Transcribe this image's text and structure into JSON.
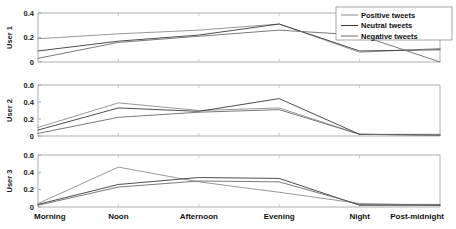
{
  "figure": {
    "background_color": "#ffffff",
    "axis_color": "#9a9a9a"
  },
  "legend": {
    "position": "top-right",
    "entries": [
      {
        "label": "Positive tweets",
        "color": "#8c8c8c"
      },
      {
        "label": "Neutral tweets",
        "color": "#3a3a3a"
      },
      {
        "label": "Negative tweets",
        "color": "#6b6b6b"
      }
    ]
  },
  "xaxis": {
    "categories": [
      "Morning",
      "Noon",
      "Afternoon",
      "Evening",
      "Night",
      "Post-midnight"
    ]
  },
  "chart_data": [
    {
      "type": "line",
      "title": "",
      "xlabel": "",
      "ylabel": "User 1",
      "categories": [
        "Morning",
        "Noon",
        "Afternoon",
        "Evening",
        "Night",
        "Post-midnight"
      ],
      "ylim": [
        0,
        0.4
      ],
      "yticks": [
        0,
        0.2,
        0.4
      ],
      "ytick_labels": [
        "0",
        "0.2",
        "0.4"
      ],
      "grid": false,
      "legend": "top-right",
      "series": [
        {
          "name": "Positive tweets",
          "color": "#8c8c8c",
          "values": [
            0.19,
            0.23,
            0.26,
            0.31,
            0.08,
            0.11
          ]
        },
        {
          "name": "Neutral tweets",
          "color": "#3a3a3a",
          "values": [
            0.09,
            0.17,
            0.22,
            0.31,
            0.09,
            0.1
          ]
        },
        {
          "name": "Negative tweets",
          "color": "#6b6b6b",
          "values": [
            0.03,
            0.16,
            0.21,
            0.26,
            0.22,
            0.0
          ]
        }
      ]
    },
    {
      "type": "line",
      "title": "",
      "xlabel": "",
      "ylabel": "User 2",
      "categories": [
        "Morning",
        "Noon",
        "Afternoon",
        "Evening",
        "Night",
        "Post-midnight"
      ],
      "ylim": [
        0,
        0.6
      ],
      "yticks": [
        0,
        0.2,
        0.4,
        0.6
      ],
      "ytick_labels": [
        "0",
        "0.2",
        "0.4",
        "0.6"
      ],
      "grid": false,
      "legend": "none",
      "series": [
        {
          "name": "Positive tweets",
          "color": "#8c8c8c",
          "values": [
            0.1,
            0.39,
            0.3,
            0.33,
            0.02,
            0.02
          ]
        },
        {
          "name": "Neutral tweets",
          "color": "#3a3a3a",
          "values": [
            0.07,
            0.33,
            0.29,
            0.44,
            0.02,
            0.01
          ]
        },
        {
          "name": "Negative tweets",
          "color": "#6b6b6b",
          "values": [
            0.03,
            0.22,
            0.28,
            0.31,
            0.02,
            0.01
          ]
        }
      ]
    },
    {
      "type": "line",
      "title": "",
      "xlabel": "",
      "ylabel": "User 3",
      "categories": [
        "Morning",
        "Noon",
        "Afternoon",
        "Evening",
        "Night",
        "Post-midnight"
      ],
      "ylim": [
        0,
        0.6
      ],
      "yticks": [
        0,
        0.2,
        0.4,
        0.6
      ],
      "ytick_labels": [
        "0",
        "0.2",
        "0.4",
        "0.6"
      ],
      "grid": false,
      "legend": "none",
      "series": [
        {
          "name": "Positive tweets",
          "color": "#8c8c8c",
          "values": [
            0.04,
            0.46,
            0.29,
            0.17,
            0.04,
            0.02
          ]
        },
        {
          "name": "Neutral tweets",
          "color": "#3a3a3a",
          "values": [
            0.03,
            0.26,
            0.34,
            0.33,
            0.02,
            0.02
          ]
        },
        {
          "name": "Negative tweets",
          "color": "#6b6b6b",
          "values": [
            0.02,
            0.23,
            0.3,
            0.29,
            0.03,
            0.03
          ]
        }
      ]
    }
  ]
}
